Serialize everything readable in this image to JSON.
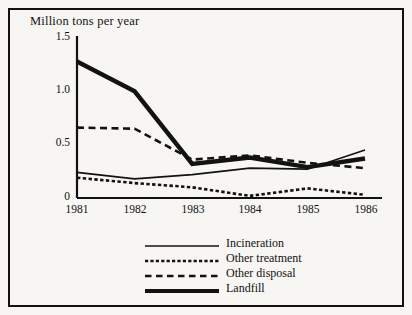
{
  "chart_data": {
    "type": "line",
    "title": "Million tons per year",
    "xlabel": "",
    "ylabel": "Million tons per year",
    "categories": [
      "1981",
      "1982",
      "1983",
      "1984",
      "1985",
      "1986"
    ],
    "x": [
      1981,
      1982,
      1983,
      1984,
      1985,
      1986
    ],
    "xlim": [
      1981,
      1986
    ],
    "ylim": [
      0,
      1.5
    ],
    "yticks": [
      0,
      0.5,
      1.0,
      1.5
    ],
    "ytick_labels": [
      "0",
      "0.5",
      "1.0",
      "1.5"
    ],
    "grid": false,
    "legend_position": "bottom-center",
    "series": [
      {
        "name": "Incineration",
        "style": "solid-thin",
        "values": [
          0.24,
          0.18,
          0.22,
          0.28,
          0.27,
          0.45
        ]
      },
      {
        "name": "Other treatment",
        "style": "dotted",
        "values": [
          0.19,
          0.14,
          0.1,
          0.02,
          0.09,
          0.03
        ]
      },
      {
        "name": "Other disposal",
        "style": "dashed",
        "values": [
          0.66,
          0.65,
          0.36,
          0.4,
          0.33,
          0.28
        ]
      },
      {
        "name": "Landfill",
        "style": "solid-thick",
        "values": [
          1.28,
          1.0,
          0.32,
          0.38,
          0.29,
          0.37
        ]
      }
    ]
  },
  "legend": {
    "items": [
      {
        "label": "Incineration",
        "style": "solid-thin"
      },
      {
        "label": "Other treatment",
        "style": "dotted"
      },
      {
        "label": "Other disposal",
        "style": "dashed"
      },
      {
        "label": "Landfill",
        "style": "solid-thick"
      }
    ]
  },
  "colors": {
    "ink": "#121212",
    "paper": "#f7f6f3"
  }
}
